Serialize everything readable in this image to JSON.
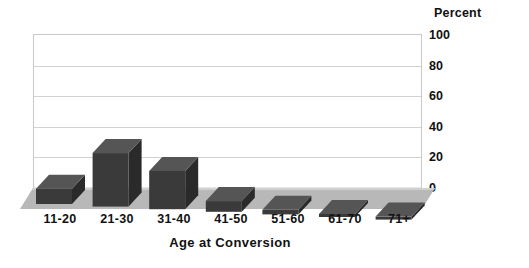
{
  "chart_data": {
    "type": "bar",
    "title": "",
    "categories": [
      "11-20",
      "21-30",
      "31-40",
      "41-50",
      "51-60",
      "61-70",
      "71+"
    ],
    "values": [
      10,
      35,
      25,
      7,
      3,
      1.5,
      1
    ],
    "xlabel": "Age at Conversion",
    "ylabel": "Percent",
    "ylim": [
      0,
      100
    ],
    "yticks": [
      0,
      20,
      40,
      60,
      80,
      100
    ],
    "ytick_labels": [
      "0",
      "20",
      "40",
      "60",
      "80",
      "100"
    ],
    "grid": "horizontal",
    "legend": "none",
    "series": [
      {
        "name": "Percent",
        "values": [
          10,
          35,
          25,
          7,
          3,
          1.5,
          1
        ]
      }
    ],
    "style": {
      "bar_face_color": "#3a3a3a",
      "bar_side_color": "#2a2a2a",
      "bar_top_color": "#555555",
      "floor_color": "#b8b8b8",
      "floor_edge_color": "#d8d8d8",
      "grid_color": "#d2d2d2",
      "frame_color": "#c9c9c9",
      "text_color": "#111111",
      "background": "#ffffff"
    }
  },
  "axis": {
    "percent_header": "Percent",
    "x_title": "Age at Conversion"
  }
}
